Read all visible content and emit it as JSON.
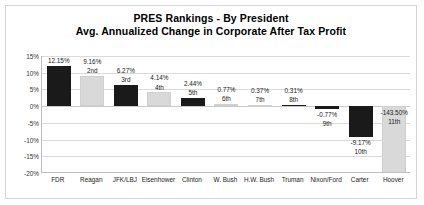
{
  "chart_data": {
    "type": "bar",
    "title": "PRES Rankings - By President",
    "subtitle": "Avg. Annualized Change in Corporate After Tax Profit",
    "xlabel": "",
    "ylabel": "",
    "ylim": [
      -20,
      15
    ],
    "grid": true,
    "legend": "none",
    "ytick_labels": [
      "15%",
      "10%",
      "5%",
      "0%",
      "-5%",
      "-10%",
      "-15%",
      "-20%"
    ],
    "ytick_values": [
      15,
      10,
      5,
      0,
      -5,
      -10,
      -15,
      -20
    ],
    "categories": [
      "FDR",
      "Reagan",
      "JFK/LBJ",
      "Eisenhower",
      "Clinton",
      "W. Bush",
      "H.W. Bush",
      "Truman",
      "Nixon/Ford",
      "Carter",
      "Hoover"
    ],
    "values": [
      12.15,
      9.16,
      6.27,
      4.14,
      2.44,
      0.77,
      0.37,
      0.31,
      -0.77,
      -9.17,
      -143.5
    ],
    "value_labels": [
      "12.15%",
      "9.16%",
      "6.27%",
      "4.14%",
      "2.44%",
      "0.77%",
      "0.37%",
      "0.31%",
      "-0.77%",
      "-9.17%",
      "-143.50%"
    ],
    "rank_labels": [
      "1st",
      "2nd",
      "3rd",
      "4th",
      "5th",
      "6th",
      "7th",
      "8th",
      "9th",
      "10th",
      "11th"
    ],
    "bar_colors": [
      "black",
      "gray",
      "black",
      "gray",
      "black",
      "gray",
      "gray",
      "black",
      "black",
      "black",
      "gray"
    ],
    "colors": {
      "black": "#1a1a1a",
      "gray": "#d9d9d9",
      "gridline": "#d9d9d9",
      "axis": "#bfbfbf",
      "text": "#222222",
      "background": "#ffffff",
      "border": "#d4d4d4"
    },
    "note": "Hoover bar (-143.50%) extends beyond the -20% axis minimum and is clipped at the plot bottom."
  }
}
